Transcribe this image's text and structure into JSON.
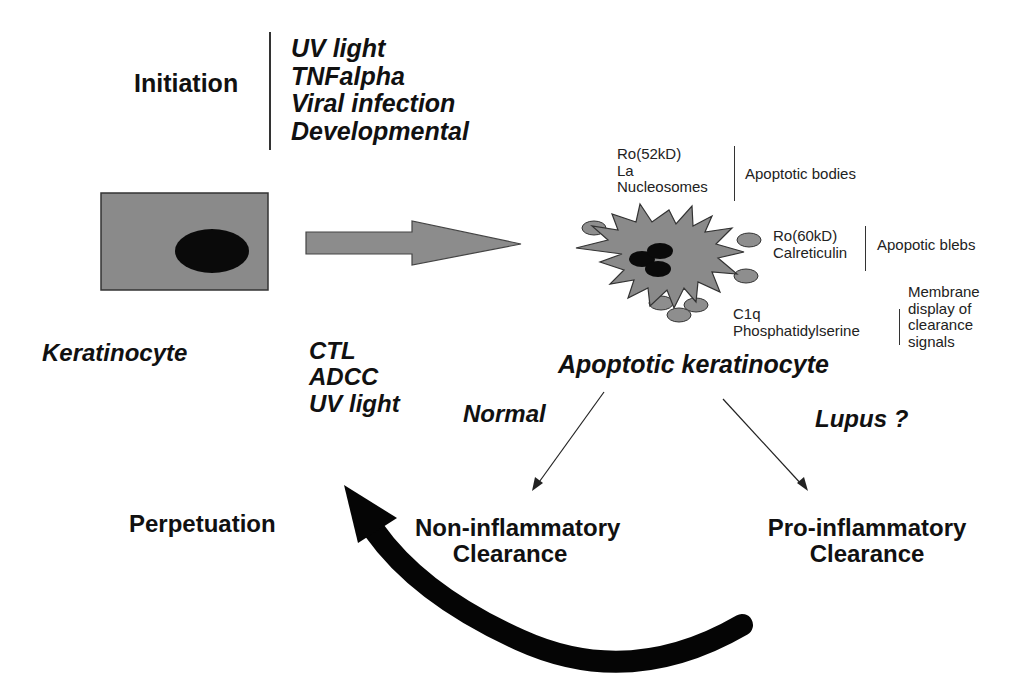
{
  "initiation": {
    "label": "Initiation",
    "triggers": [
      "UV light",
      "TNFalpha",
      "Viral infection",
      "Developmental"
    ]
  },
  "keratinocyte": {
    "label": "Keratinocyte"
  },
  "apoptosis_inducers": [
    "CTL",
    "ADCC",
    "UV light"
  ],
  "apoptotic_cell": {
    "label": "Apoptotic keratinocyte",
    "apoptotic_bodies": {
      "items": [
        "Ro(52kD)",
        "La",
        "Nucleosomes"
      ],
      "label": "Apoptotic bodies"
    },
    "apoptotic_blebs": {
      "items": [
        "Ro(60kD)",
        "Calreticulin"
      ],
      "label": "Apopotic blebs"
    },
    "membrane": {
      "items": [
        "C1q",
        "Phosphatidylserine"
      ],
      "label": [
        "Membrane",
        "display of",
        "clearance",
        "signals"
      ]
    }
  },
  "pathways": {
    "normal": {
      "label": "Normal",
      "outcome": [
        "Non-inflammatory",
        "Clearance"
      ]
    },
    "lupus": {
      "label": "Lupus ?",
      "outcome": [
        "Pro-inflammatory",
        "Clearance"
      ]
    }
  },
  "perpetuation": {
    "label": "Perpetuation"
  },
  "colors": {
    "cell_fill": "#8a8a8a",
    "nucleus": "#0a0a0a",
    "arrow_fill": "#8c8c8c",
    "bleb_fill": "#8e8e8e",
    "text": "#111111"
  }
}
